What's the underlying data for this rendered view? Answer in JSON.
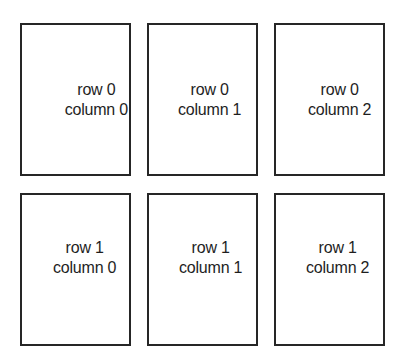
{
  "diagram": {
    "type": "grid-layout",
    "rows": 2,
    "columns": 3,
    "border_color": "#262626",
    "background_color": "#ffffff",
    "cells": [
      [
        {
          "line1": "row 0",
          "line2": "column 0"
        },
        {
          "line1": "row 0",
          "line2": "column 1"
        },
        {
          "line1": "row 0",
          "line2": "column 2"
        }
      ],
      [
        {
          "line1": "row 1",
          "line2": "column 0"
        },
        {
          "line1": "row 1",
          "line2": "column 1"
        },
        {
          "line1": "row 1",
          "line2": "column 2"
        }
      ]
    ]
  }
}
